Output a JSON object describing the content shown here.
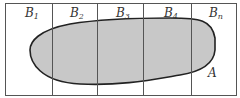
{
  "diagram": {
    "type": "partition-venn",
    "partitions": [
      {
        "base": "B",
        "sub": "1"
      },
      {
        "base": "B",
        "sub": "2"
      },
      {
        "base": "B",
        "sub": "3"
      },
      {
        "base": "B",
        "sub": "4"
      },
      {
        "base": "B",
        "sub": "n"
      }
    ],
    "region_label": "A",
    "colors": {
      "border": "#555555",
      "fill": "#c8c8c8",
      "outline": "#222222"
    }
  }
}
